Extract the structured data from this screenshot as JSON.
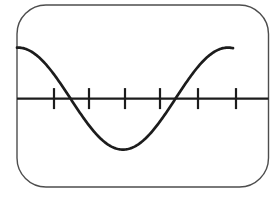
{
  "figure": {
    "background_color": "#ffffff",
    "screen": {
      "x": 17,
      "y": 5,
      "width": 251.5,
      "height": 182,
      "corner_radius": 29,
      "border_color": "#4d4d4d",
      "border_width": 1.4,
      "fill": "#ffffff"
    },
    "axis": {
      "y": 98.6,
      "x_start": 17,
      "x_end": 268.5,
      "color": "#1c1c1c",
      "stroke_width": 2.2,
      "tick_xs": [
        54,
        89,
        125,
        160,
        198,
        236
      ],
      "tick_half_height": 10.5,
      "tick_stroke_width": 2.2
    },
    "waveform": {
      "type": "sine",
      "color": "#1c1c1c",
      "stroke_width": 2.7,
      "x_start": 17,
      "x_end": 233,
      "peak_x": 18,
      "period": 210,
      "amplitude": 51,
      "center_y": 98.6,
      "trough_point": {
        "x": 123,
        "y": 148
      },
      "axis_crossings_x": [
        71,
        176
      ]
    }
  }
}
